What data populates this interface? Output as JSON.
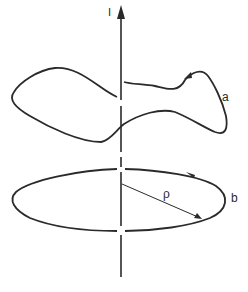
{
  "figure": {
    "labels": {
      "current": "I",
      "loop_a": "a",
      "loop_b": "b",
      "radius": "ρ"
    },
    "colors": {
      "stroke": "#2a2a2a",
      "background": "#ffffff"
    }
  }
}
